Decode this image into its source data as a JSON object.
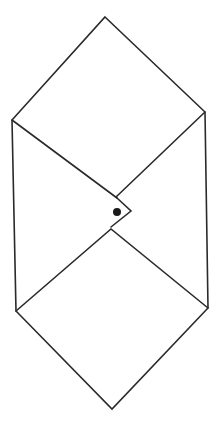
{
  "figure": {
    "description": "Line drawing of an envelope-like hexagonal shape with a folded flap and a dot",
    "stroke_color": "#2a2a2a",
    "dot_color": "#1a1a1a",
    "background": "#ffffff"
  },
  "shapes": {
    "outline": [
      [
        105,
        17
      ],
      [
        205,
        112
      ],
      [
        208,
        308
      ],
      [
        112,
        409
      ],
      [
        16,
        311
      ],
      [
        12,
        120
      ]
    ],
    "upper_flap_left": [
      [
        12,
        120
      ],
      [
        117,
        198
      ]
    ],
    "upper_flap_right": [
      [
        205,
        112
      ],
      [
        116,
        197
      ]
    ],
    "flap_tip": [
      [
        117,
        198
      ],
      [
        131,
        211
      ],
      [
        111,
        227
      ]
    ],
    "lower_diamond": [
      [
        16,
        311
      ],
      [
        111,
        229
      ],
      [
        208,
        308
      ]
    ],
    "dot": {
      "cx": 117,
      "cy": 212,
      "r": 4
    }
  }
}
